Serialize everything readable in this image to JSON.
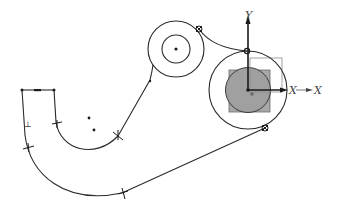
{
  "sketch": {
    "background": "#ffffff",
    "line_color": "#2a2a2a",
    "fill_color": "#a8a8a8",
    "axes": {
      "y_label": "Y",
      "x_label": "X",
      "x_label_secondary": "X",
      "y_label_secondary": "Y"
    },
    "constraint_glyph": "⊥",
    "elements": [
      {
        "type": "line",
        "name": "top-horizontal-line"
      },
      {
        "type": "line",
        "name": "outer-left-line"
      },
      {
        "type": "arc",
        "name": "outer-bottom-arc"
      },
      {
        "type": "line",
        "name": "outer-tangent-line"
      },
      {
        "type": "line",
        "name": "inner-left-line"
      },
      {
        "type": "arc",
        "name": "inner-arc"
      },
      {
        "type": "line",
        "name": "inner-tangent-line"
      },
      {
        "type": "circle",
        "name": "upper-outer-circle"
      },
      {
        "type": "circle",
        "name": "upper-inner-circle"
      },
      {
        "type": "arc",
        "name": "connecting-arc"
      },
      {
        "type": "circle",
        "name": "right-outer-circle"
      },
      {
        "type": "circle",
        "name": "right-filled-circle"
      },
      {
        "type": "rect",
        "name": "right-filled-square"
      }
    ]
  }
}
